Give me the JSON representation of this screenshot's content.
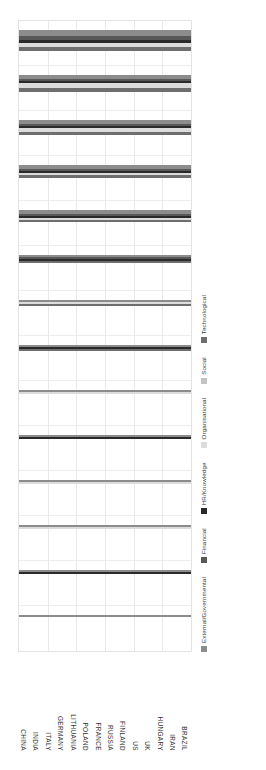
{
  "chart_data": {
    "type": "bar",
    "subtype": "stacked-horizontal-rotated",
    "title": "",
    "xlabel": "",
    "ylabel": "",
    "orientation": "bars extend upward; figure rendered rotated 90 degrees counter-clockwise",
    "grid": true,
    "legend_position": "left-of-plot (rotated: vertical strip at left of image)",
    "categories": [
      "CHINA",
      "INDIA",
      "ITALY",
      "GERMANY",
      "LITHUANIA",
      "POLAND",
      "FRANCE",
      "RUSSIA",
      "FINLAND",
      "US",
      "UK",
      "HUNGARY",
      "IRAN",
      "BRAZIL"
    ],
    "series": [
      {
        "name": "External/Governmental",
        "color": "#8c8c8c",
        "values": [
          1.0,
          1.0,
          1.0,
          1.0,
          1.0,
          1.0,
          1.0,
          1.0,
          1.0,
          2.0,
          2.0,
          2.0,
          2.0,
          3.0
        ]
      },
      {
        "name": "Financial",
        "color": "#585858",
        "values": [
          0.0,
          0.0,
          0.0,
          0.0,
          0.0,
          0.0,
          0.0,
          0.0,
          1.0,
          1.0,
          1.0,
          1.0,
          1.0,
          2.0
        ]
      },
      {
        "name": "HR/Knowledge",
        "color": "#2a2a2a",
        "values": [
          0.0,
          1.0,
          0.0,
          0.0,
          1.0,
          0.0,
          1.0,
          0.0,
          1.0,
          1.0,
          1.0,
          1.0,
          1.0,
          2.0
        ]
      },
      {
        "name": "Organisational",
        "color": "#dcdcdc",
        "values": [
          0.0,
          0.0,
          1.0,
          1.0,
          0.0,
          1.0,
          0.0,
          1.0,
          0.0,
          1.0,
          1.0,
          2.0,
          3.0,
          2.0
        ]
      },
      {
        "name": "Social",
        "color": "#c4c4c4",
        "values": [
          0.0,
          0.0,
          0.0,
          0.0,
          0.0,
          0.0,
          0.0,
          0.0,
          0.0,
          0.0,
          0.0,
          0.0,
          0.0,
          0.0
        ]
      },
      {
        "name": "Technological",
        "color": "#6e6e6e",
        "values": [
          0.0,
          0.0,
          0.0,
          0.0,
          0.0,
          0.0,
          1.0,
          1.0,
          1.0,
          1.0,
          2.0,
          2.0,
          2.0,
          2.0
        ]
      }
    ],
    "totals": [
      1,
      2,
      2,
      2,
      2,
      2,
      3,
      3,
      4,
      6,
      7,
      8,
      9,
      11
    ],
    "axis_max": 14,
    "legend_entries": [
      "External/Governmental",
      "Financial",
      "HR/Knowledge",
      "Organisational",
      "Social",
      "Technological"
    ],
    "vertical_gridlines": 14,
    "horizontal_gridlines": 6
  },
  "colors": {
    "plot_background": "#ffffff",
    "plot_border": "#e3e3e3",
    "gridline": "#ededed",
    "label_text": "#2f2f2f"
  }
}
